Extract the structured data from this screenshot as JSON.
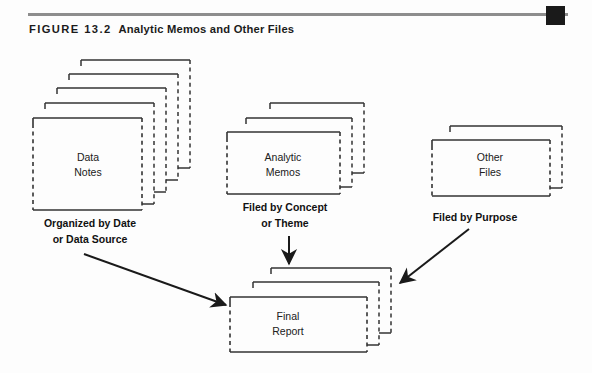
{
  "figure": {
    "number_label": "FIGURE 13.2",
    "title": "Analytic Memos and Other Files",
    "rule_color": "#8d8d8d",
    "cap_color": "#1a1a1a",
    "line_color": "#333333",
    "text_color": "#1b1b1b",
    "background": "#fdfdfd"
  },
  "stacks": [
    {
      "id": "data-notes",
      "label_line1": "Data",
      "label_line2": "Notes",
      "layers": 5,
      "caption_line1": "Organized by Date",
      "caption_line2": "or Data Source"
    },
    {
      "id": "analytic-memos",
      "label_line1": "Analytic",
      "label_line2": "Memos",
      "layers": 3,
      "caption_line1": "Filed by Concept",
      "caption_line2": "or Theme"
    },
    {
      "id": "other-files",
      "label_line1": "Other",
      "label_line2": "Files",
      "layers": 2,
      "caption_line1": "Filed by Purpose",
      "caption_line2": ""
    },
    {
      "id": "final-report",
      "label_line1": "Final",
      "label_line2": "Report",
      "layers": 3,
      "caption_line1": "",
      "caption_line2": ""
    }
  ],
  "arrows": [
    {
      "id": "data-notes-to-final-report",
      "from": "data-notes",
      "to": "final-report",
      "direction": "down-right"
    },
    {
      "id": "analytic-memos-to-final-report",
      "from": "analytic-memos",
      "to": "final-report",
      "direction": "down"
    },
    {
      "id": "other-files-to-final-report",
      "from": "other-files",
      "to": "final-report",
      "direction": "down-left"
    }
  ]
}
